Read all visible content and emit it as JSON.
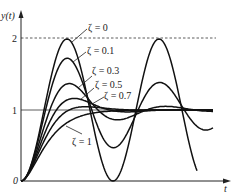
{
  "chart_data": {
    "type": "line",
    "title": "",
    "xlabel": "t",
    "ylabel": "y(t)",
    "ylim": [
      0,
      2.1
    ],
    "y_ticks": [
      "0",
      "1",
      "2"
    ],
    "reference_lines": [
      {
        "y": 1,
        "style": "solid"
      },
      {
        "y": 2,
        "style": "dashed"
      }
    ],
    "grid": false,
    "legend": "inline annotations with leader lines",
    "omega_n_t_period_px": 92,
    "series": [
      {
        "name": "ζ = 0",
        "zeta": 0.0,
        "peak": 2.0
      },
      {
        "name": "ζ = 0.1",
        "zeta": 0.1,
        "peak": 1.73
      },
      {
        "name": "ζ = 0.3",
        "zeta": 0.3,
        "peak": 1.37
      },
      {
        "name": "ζ = 0.5",
        "zeta": 0.5,
        "peak": 1.16
      },
      {
        "name": "ζ = 0.7",
        "zeta": 0.7,
        "peak": 1.05
      },
      {
        "name": "ζ = 1",
        "zeta": 1.0,
        "peak": 1.0
      }
    ]
  },
  "axes": {
    "y_label": "y(t)",
    "x_label": "t",
    "tick_0": "0",
    "tick_1": "1",
    "tick_2": "2"
  },
  "annotations": {
    "z0": "ζ = 0",
    "z01": "ζ = 0.1",
    "z03": "ζ = 0.3",
    "z05": "ζ = 0.5",
    "z07": "ζ = 0.7",
    "z1": "ζ = 1"
  }
}
